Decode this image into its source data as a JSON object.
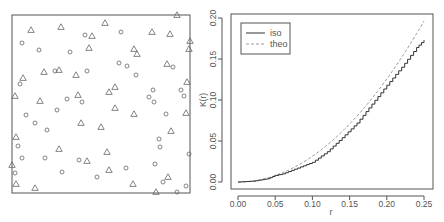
{
  "chart_data": [
    {
      "type": "scatter",
      "title": "",
      "description": "Marked point pattern in unit square window; two marks shown as triangles and circles",
      "frame": {
        "x0": 12,
        "y0": 15,
        "x1": 190,
        "y1": 193
      },
      "series": [
        {
          "name": "triangle",
          "marker": "triangle",
          "points_px": [
            [
              31,
              30
            ],
            [
              61,
              27
            ],
            [
              105,
              23
            ],
            [
              177,
              15
            ],
            [
              152,
              32
            ],
            [
              170,
              34
            ],
            [
              92,
              36
            ],
            [
              190,
              41
            ],
            [
              89,
              48
            ],
            [
              134,
              49
            ],
            [
              137,
              54
            ],
            [
              189,
              49
            ],
            [
              167,
              64
            ],
            [
              44,
              72
            ],
            [
              59,
              70
            ],
            [
              76,
              75
            ],
            [
              23,
              78
            ],
            [
              187,
              82
            ],
            [
              115,
              87
            ],
            [
              109,
              92
            ],
            [
              15,
              96
            ],
            [
              78,
              95
            ],
            [
              40,
              101
            ],
            [
              115,
              108
            ],
            [
              134,
              114
            ],
            [
              186,
              113
            ],
            [
              81,
              123
            ],
            [
              101,
              127
            ],
            [
              171,
              131
            ],
            [
              16,
              137
            ],
            [
              59,
              149
            ],
            [
              107,
              152
            ],
            [
              87,
              161
            ],
            [
              12,
              165
            ],
            [
              109,
              170
            ],
            [
              168,
              177
            ],
            [
              16,
              184
            ],
            [
              35,
              188
            ],
            [
              133,
              184
            ],
            [
              156,
              192
            ]
          ]
        },
        {
          "name": "circle",
          "marker": "circle",
          "points_px": [
            [
              22,
              43
            ],
            [
              39,
              50
            ],
            [
              70,
              52
            ],
            [
              85,
              35
            ],
            [
              121,
              32
            ],
            [
              55,
              71
            ],
            [
              87,
              71
            ],
            [
              119,
              63
            ],
            [
              127,
              66
            ],
            [
              136,
              75
            ],
            [
              173,
              67
            ],
            [
              20,
              84
            ],
            [
              67,
              99
            ],
            [
              82,
              102
            ],
            [
              57,
              110
            ],
            [
              153,
              90
            ],
            [
              149,
              97
            ],
            [
              154,
              102
            ],
            [
              181,
              90
            ],
            [
              184,
              96
            ],
            [
              26,
              115
            ],
            [
              35,
              123
            ],
            [
              47,
              130
            ],
            [
              166,
              114
            ],
            [
              18,
              146
            ],
            [
              22,
              158
            ],
            [
              45,
              158
            ],
            [
              159,
              139
            ],
            [
              160,
              147
            ],
            [
              189,
              154
            ],
            [
              79,
              160
            ],
            [
              62,
              172
            ],
            [
              97,
              177
            ],
            [
              126,
              168
            ],
            [
              155,
              164
            ],
            [
              15,
              173
            ],
            [
              163,
              182
            ],
            [
              177,
              192
            ],
            [
              186,
              186
            ]
          ]
        }
      ]
    },
    {
      "type": "line",
      "title": "",
      "xlabel": "r",
      "ylabel": "K(r)",
      "xlim": [
        0,
        0.25
      ],
      "ylim": [
        0,
        0.2
      ],
      "xticks": [
        "0.00",
        "0.05",
        "0.10",
        "0.15",
        "0.20",
        "0.25"
      ],
      "yticks": [
        "0.00",
        "0.05",
        "0.10",
        "0.15",
        "0.20"
      ],
      "grid": false,
      "legend_position": "top-left",
      "x": [
        0.0,
        0.02,
        0.04,
        0.05,
        0.06,
        0.08,
        0.1,
        0.12,
        0.14,
        0.16,
        0.18,
        0.2,
        0.22,
        0.24,
        0.25
      ],
      "series": [
        {
          "name": "iso",
          "style": "solid",
          "values": [
            0.0,
            0.001,
            0.004,
            0.008,
            0.01,
            0.017,
            0.024,
            0.037,
            0.054,
            0.072,
            0.095,
            0.118,
            0.14,
            0.164,
            0.173
          ]
        },
        {
          "name": "theo",
          "style": "dashed",
          "values": [
            0.0,
            0.0013,
            0.005,
            0.0079,
            0.0113,
            0.0201,
            0.0314,
            0.0452,
            0.0616,
            0.0804,
            0.1018,
            0.1257,
            0.1521,
            0.181,
            0.1963
          ]
        }
      ]
    }
  ],
  "left_panel": {},
  "right_panel": {
    "xlabel": "r",
    "ylabel": "K(r)",
    "legend": [
      {
        "label": "iso",
        "style": "solid"
      },
      {
        "label": "theo",
        "style": "dashed"
      }
    ],
    "xticks": [
      "0.00",
      "0.05",
      "0.10",
      "0.15",
      "0.20",
      "0.25"
    ],
    "yticks": [
      "0.00",
      "0.05",
      "0.10",
      "0.15",
      "0.20"
    ]
  },
  "colors": {
    "frame": "#555555",
    "marker": "#666666",
    "iso_line": "#333333",
    "theo_line": "#999999",
    "text": "#555555"
  }
}
